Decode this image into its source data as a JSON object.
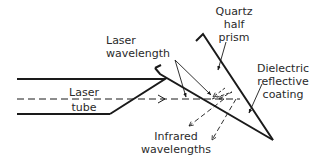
{
  "diagram": {
    "labels": {
      "laser_wavelength": [
        "Laser",
        "wavelength"
      ],
      "quartz_half_prism": [
        "Quartz",
        "half",
        "prism"
      ],
      "dielectric_coating": [
        "Dielectric",
        "reflective",
        "coating"
      ],
      "laser_tube": [
        "Laser",
        "tube"
      ],
      "infrared_wavelengths": [
        "Infrared",
        "wavelengths"
      ]
    },
    "colors": {
      "stroke": "#1a1a1a",
      "text": "#2a2a2a",
      "background": "#ffffff"
    }
  }
}
